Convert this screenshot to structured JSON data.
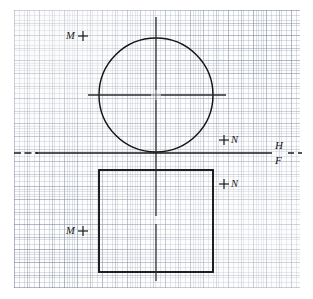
{
  "drawing": {
    "title": "Orthographic projection: top view circle and front view square",
    "paper": {
      "type": "graph-paper",
      "fine_grid_px": 2.52,
      "heavy_grid_px": 12.6,
      "paper_color": "#fdfdfd",
      "grid_color": "#8892a6"
    },
    "ink_color": "#141414",
    "views": {
      "top_view": {
        "name": "circle",
        "center_x": 156,
        "center_y": 95,
        "radius": 57
      },
      "front_view": {
        "name": "square",
        "left": 99,
        "top": 170,
        "width": 114,
        "height": 102
      }
    },
    "fold_line": {
      "y": 153,
      "upper_label": "H",
      "lower_label": "F",
      "label_x": 278
    },
    "centerlines": {
      "vertical_x": 156,
      "horizontal_y": 95
    }
  },
  "labels": {
    "point_m_top": {
      "text": "M",
      "mark": "+",
      "x": 68,
      "y": 31
    },
    "point_n_top": {
      "text": "N",
      "mark": "+",
      "x": 222,
      "y": 134
    },
    "point_n_front": {
      "text": "N",
      "mark": "+",
      "x": 222,
      "y": 178
    },
    "point_m_front": {
      "text": "M",
      "mark": "+",
      "x": 68,
      "y": 226
    },
    "plane_h": {
      "text": "H"
    },
    "plane_f": {
      "text": "F"
    }
  }
}
